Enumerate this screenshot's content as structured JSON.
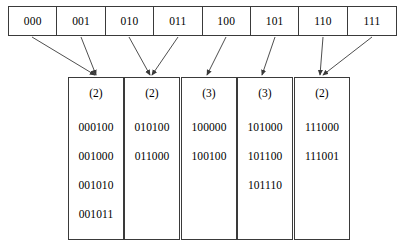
{
  "figure": {
    "line_color": "#3a3a3a",
    "background_color": "#ffffff",
    "text_color": "#000000"
  },
  "directory": {
    "name": "directory",
    "cells": [
      {
        "label": "000",
        "points_to": 0
      },
      {
        "label": "001",
        "points_to": 0
      },
      {
        "label": "010",
        "points_to": 1
      },
      {
        "label": "011",
        "points_to": 1
      },
      {
        "label": "100",
        "points_to": 2
      },
      {
        "label": "101",
        "points_to": 3
      },
      {
        "label": "110",
        "points_to": 4
      },
      {
        "label": "111",
        "points_to": 4
      }
    ]
  },
  "buckets": [
    {
      "depth": "(2)",
      "entries": [
        "000100",
        "001000",
        "001010",
        "001011"
      ]
    },
    {
      "depth": "(2)",
      "entries": [
        "010100",
        "011000"
      ]
    },
    {
      "depth": "(3)",
      "entries": [
        "100000",
        "100100"
      ]
    },
    {
      "depth": "(3)",
      "entries": [
        "101000",
        "101100",
        "101110"
      ]
    },
    {
      "depth": "(2)",
      "entries": [
        "111000",
        "111001"
      ]
    }
  ],
  "arrows": [
    {
      "name": "arrow-000-to-bucket-0",
      "from_cell": "000",
      "to_bucket": 0
    },
    {
      "name": "arrow-001-to-bucket-0",
      "from_cell": "001",
      "to_bucket": 0
    },
    {
      "name": "arrow-010-to-bucket-1",
      "from_cell": "010",
      "to_bucket": 1
    },
    {
      "name": "arrow-011-to-bucket-1",
      "from_cell": "011",
      "to_bucket": 1
    },
    {
      "name": "arrow-100-to-bucket-2",
      "from_cell": "100",
      "to_bucket": 2
    },
    {
      "name": "arrow-101-to-bucket-3",
      "from_cell": "101",
      "to_bucket": 3
    },
    {
      "name": "arrow-110-to-bucket-4",
      "from_cell": "110",
      "to_bucket": 4
    },
    {
      "name": "arrow-111-to-bucket-4",
      "from_cell": "111",
      "to_bucket": 4
    }
  ]
}
